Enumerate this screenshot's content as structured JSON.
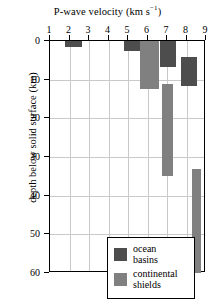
{
  "chart_data": {
    "type": "bar",
    "orientation": "horizontal-range",
    "title": "P-wave velocity (km s−1)",
    "title_main": "P-wave velocity (km s",
    "title_sup": "−1",
    "title_close": ")",
    "xlabel": "P-wave velocity (km s^-1)",
    "ylabel": "depth below solid surface (km)",
    "xlim": [
      1,
      9
    ],
    "ylim": [
      60,
      0
    ],
    "y_inverted": true,
    "grid": true,
    "xticks": [
      1,
      2,
      3,
      4,
      5,
      6,
      7,
      8,
      9
    ],
    "yticks": [
      0,
      10,
      20,
      30,
      40,
      50,
      60
    ],
    "legend_position": "lower-left-inside",
    "series": [
      {
        "name": "ocean basins",
        "color": "#4d4d4d",
        "blocks": [
          {
            "vmin": 1.78,
            "vmax": 2.62,
            "depth_top": 0.0,
            "depth_bottom": 1.6
          },
          {
            "vmin": 4.8,
            "vmax": 5.62,
            "depth_top": 0.0,
            "depth_bottom": 2.6
          },
          {
            "vmin": 6.62,
            "vmax": 7.44,
            "depth_top": 0.0,
            "depth_bottom": 6.7
          },
          {
            "vmin": 7.7,
            "vmax": 8.52,
            "depth_top": 4.1,
            "depth_bottom": 11.6
          }
        ]
      },
      {
        "name": "continental shields",
        "color": "#808080",
        "blocks": [
          {
            "vmin": 5.62,
            "vmax": 6.6,
            "depth_top": 0.0,
            "depth_bottom": 12.4
          },
          {
            "vmin": 6.72,
            "vmax": 7.32,
            "depth_top": 11.0,
            "depth_bottom": 35.0
          },
          {
            "vmin": 8.3,
            "vmax": 8.72,
            "depth_top": 33.2,
            "depth_bottom": 60.0
          }
        ]
      }
    ]
  },
  "legend": {
    "items": [
      {
        "label_line1": "ocean",
        "label_line2": "basins",
        "color": "#4d4d4d",
        "name": "ocean basins"
      },
      {
        "label_line1": "continental",
        "label_line2": "shields",
        "color": "#808080",
        "name": "continental shields"
      }
    ]
  }
}
